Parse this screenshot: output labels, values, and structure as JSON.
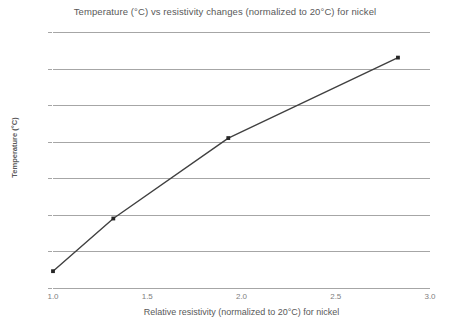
{
  "chart_data": {
    "type": "line",
    "title": "Temperature (°C) vs resistivity changes (normalized to 20°C) for nickel",
    "xlabel": "Relative resistivity (normalized to 20°C) for nickel",
    "ylabel": "Temperature (°C)",
    "xlim": [
      1.0,
      3.0
    ],
    "ylim": [
      0,
      350
    ],
    "xticks": [
      1.0,
      1.5,
      2.0,
      2.5,
      3.0
    ],
    "xtick_labels": [
      "1.0",
      "1.5",
      "2.0",
      "2.5",
      "3.0"
    ],
    "yticks": [
      0,
      50,
      100,
      150,
      200,
      250,
      300,
      350
    ],
    "ytick_labels": [
      "0",
      "50",
      "100",
      "150",
      "200",
      "250",
      "300",
      "350"
    ],
    "grid": "horizontal",
    "legend": "none",
    "series": [
      {
        "name": "nickel",
        "line_color": "#404040",
        "marker": "square",
        "marker_color": "#262626",
        "x": [
          1.0,
          1.32,
          1.93,
          2.83
        ],
        "y": [
          23,
          95,
          205,
          315
        ]
      }
    ]
  },
  "colors": {
    "background": "#ffffff",
    "gridline": "#a6a6a6",
    "tick_text": "#808080",
    "title_text": "#595959",
    "series_line": "#404040"
  }
}
